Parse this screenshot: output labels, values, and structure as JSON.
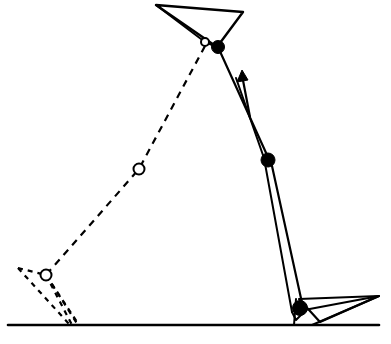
{
  "figure": {
    "canvas": {
      "width": 391,
      "height": 344,
      "background": "#ffffff"
    },
    "ink_color": "#000000"
  },
  "style": {
    "solid_stroke_width": 2.0,
    "thin_stroke_width": 1.8,
    "ground_stroke_width": 2.6,
    "dashed_stroke_width": 2.2,
    "dash_pattern": "7 6",
    "dash_pattern_short": "5 5"
  },
  "ground": {
    "label": "ground-line",
    "x1": 8,
    "y1": 325,
    "x2": 379,
    "y2": 325
  },
  "current_pose": {
    "label": "current-pose",
    "line_style": "solid",
    "thigh_triangle": {
      "label": "upper-body-triangle",
      "points": "156,5 243,12 217,47"
    },
    "thigh_triangle_inner_edge": {
      "label": "upper-body-inner-edge",
      "points": "156,5 205,42 217,47"
    },
    "hip_joint": {
      "label": "hip-joint",
      "cx": 218,
      "cy": 47,
      "r": 6.5
    },
    "hip_pivot_open": {
      "label": "hip-pivot-open-circle",
      "cx": 205,
      "cy": 42,
      "r": 4.0
    },
    "knee_joint": {
      "label": "knee-joint",
      "cx": 268,
      "cy": 160,
      "r": 7.0
    },
    "ankle_joint": {
      "label": "ankle-joint",
      "cx": 300,
      "cy": 308,
      "r": 7.5
    },
    "shank_outer": {
      "label": "shank-outer-edge",
      "points": "218,47 272,166 304,312"
    },
    "shank_inner": {
      "label": "shank-inner-edge",
      "points": "236,78 264,158 292,312"
    },
    "shank_tip_closure": {
      "label": "shank-tip-closure",
      "points": "292,312 296,320 304,312"
    },
    "foot_triangle": {
      "label": "foot-triangle",
      "points": "299,299 379,296 320,322"
    },
    "foot_triangle_inner": {
      "label": "foot-triangle-inner-edge",
      "points": "299,311 379,296 312,325"
    },
    "foot_ground_contact": {
      "label": "foot-ground-contact",
      "points": "296,299 294,325"
    }
  },
  "previous_pose": {
    "label": "previous-pose",
    "line_style": "dashed",
    "thigh_dashed_link": {
      "label": "dashed-thigh-link",
      "points": "205,46 139,169 46,275"
    },
    "mid_open_joint": {
      "label": "previous-knee-open-circle",
      "cx": 139,
      "cy": 169,
      "r": 5.5
    },
    "ankle_open_joint": {
      "label": "previous-ankle-open-circle",
      "cx": 46,
      "cy": 275,
      "r": 5.5
    },
    "foot_triangle_dashed": {
      "label": "dashed-foot-triangle",
      "points": "18,268 46,275 78,325"
    },
    "foot_dashed_edge_a": {
      "label": "dashed-foot-edge-outer",
      "points": "18,268 70,325"
    },
    "foot_dashed_edge_b": {
      "label": "dashed-foot-edge-inner",
      "points": "46,275 72,325"
    },
    "shank_dashed": {
      "label": "dashed-shank-link",
      "points": "46,275 79,325"
    }
  },
  "velocity_arrow": {
    "label": "velocity-arrow",
    "shaft": {
      "x1": 250,
      "y1": 117,
      "x2": 242,
      "y2": 75
    },
    "head_points": "242,70 237,82 248,80",
    "direction": "up",
    "note": "Arrow indicates direction of motion of the thigh link"
  }
}
